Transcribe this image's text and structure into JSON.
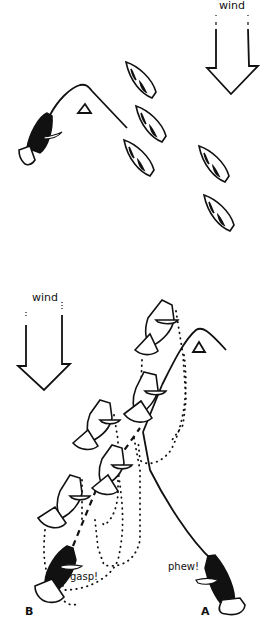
{
  "diagram": {
    "top_panel": {
      "wind_label": "wind",
      "mark": "triangle-mark",
      "boats_fleet_count": 5
    },
    "bottom_panel": {
      "wind_label": "wind",
      "boat_a_label": "A",
      "boat_b_label": "B",
      "boat_a_exclaim": "phew!",
      "boat_b_exclaim": "gasp!"
    },
    "colors": {
      "ink": "#111111",
      "background": "#ffffff"
    }
  }
}
